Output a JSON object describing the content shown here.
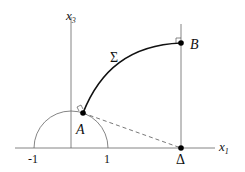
{
  "diagram": {
    "axes": {
      "horizontal": {
        "label_main": "x",
        "label_sub": "1"
      },
      "vertical": {
        "label_main": "x",
        "label_sub": "3"
      }
    },
    "ticks": [
      {
        "label": "-1"
      },
      {
        "label": "1"
      }
    ],
    "points": {
      "A": {
        "label": "A"
      },
      "B": {
        "label": "B"
      },
      "Delta": {
        "label": "Δ"
      }
    },
    "curve": {
      "label": "Σ"
    },
    "colors": {
      "axis": "#666666",
      "curve": "#111111",
      "point": "#000000",
      "dashed": "#555555"
    }
  }
}
